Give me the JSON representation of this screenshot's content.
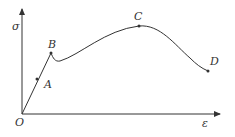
{
  "diagram": {
    "title": "",
    "axes": {
      "y_label": "σ",
      "x_label": "ε",
      "origin_label": "O"
    },
    "points": [
      {
        "id": "A",
        "label": "A"
      },
      {
        "id": "B",
        "label": "B"
      },
      {
        "id": "C",
        "label": "C"
      },
      {
        "id": "D",
        "label": "D"
      }
    ],
    "colors": {
      "stroke": "#333333",
      "background": "#ffffff"
    }
  }
}
